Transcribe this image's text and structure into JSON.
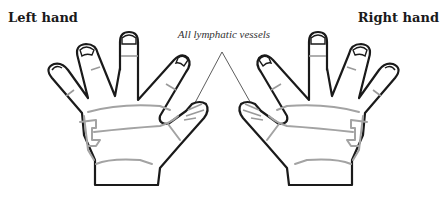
{
  "labels": {
    "left_hand": "Left hand",
    "right_hand": "Right hand",
    "vessels": "All lymphatic vessels"
  },
  "colors": {
    "outline": "#1a1a1a",
    "vessel_lines": "#a3a3a3",
    "background": "#ffffff"
  },
  "diagram": {
    "parts": [
      "left-hand",
      "right-hand",
      "lymphatic-vessel-lines",
      "leader-lines"
    ]
  }
}
